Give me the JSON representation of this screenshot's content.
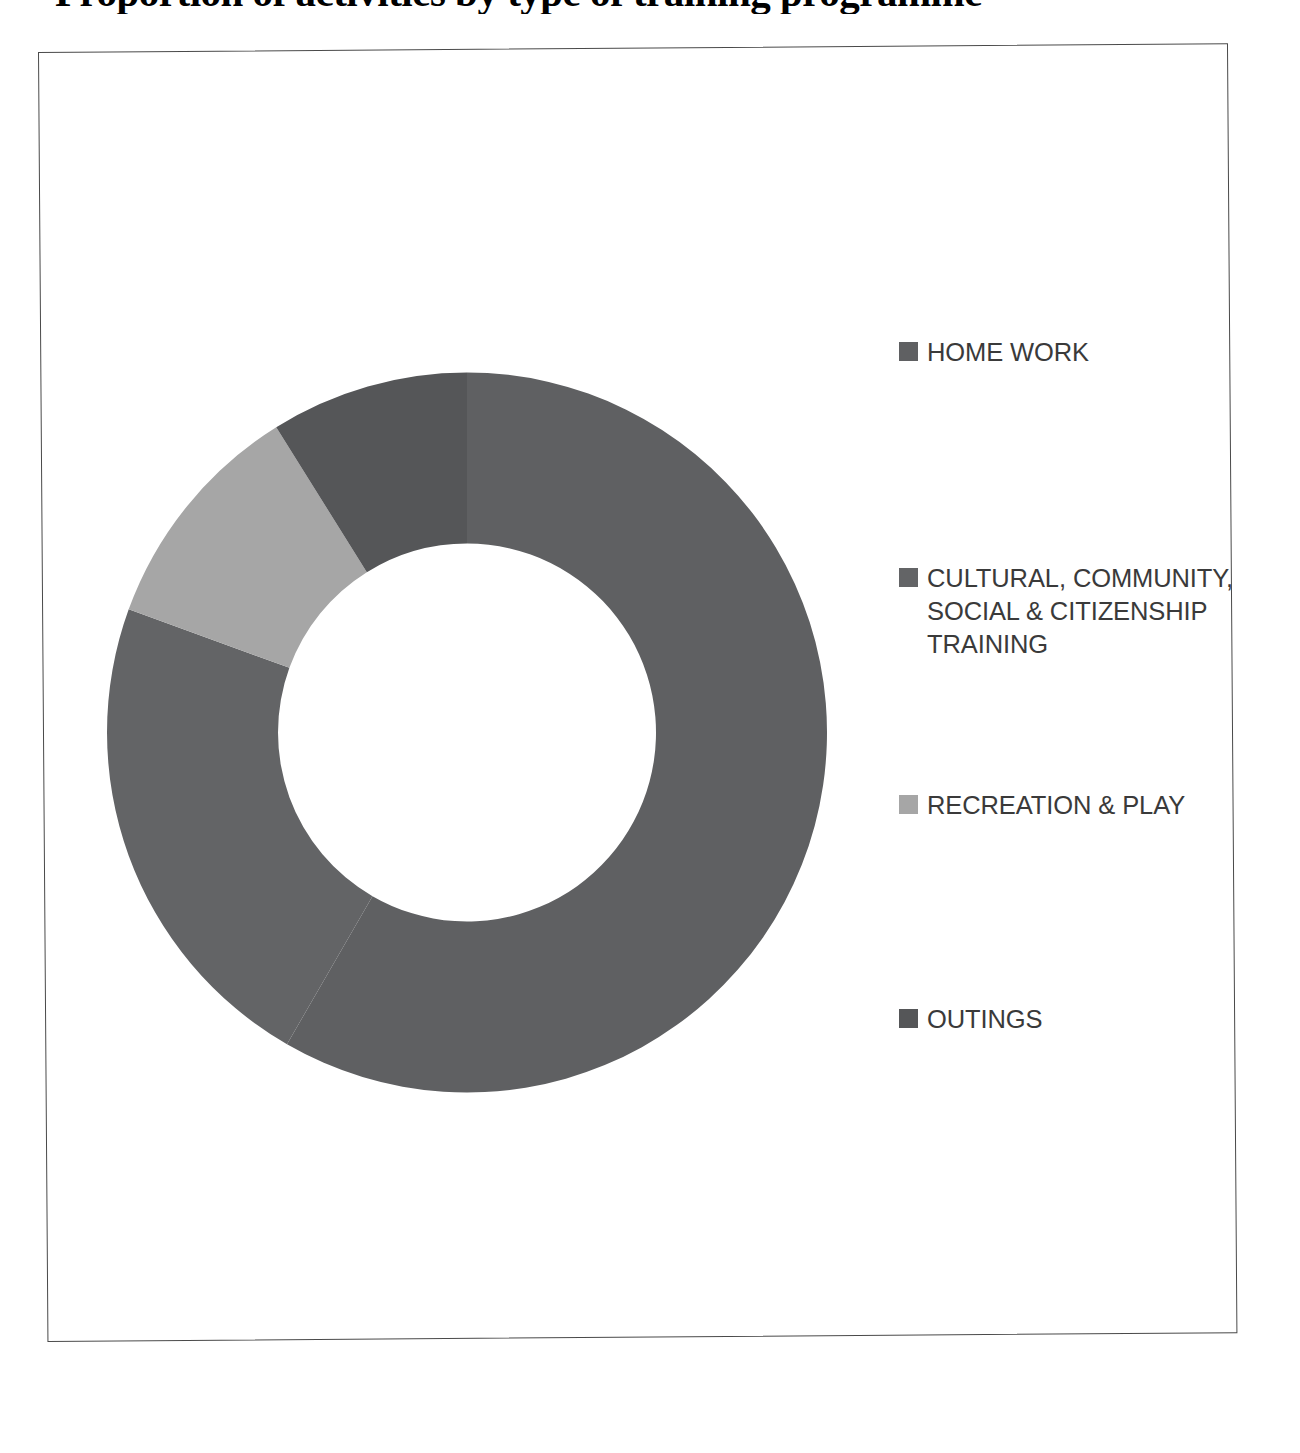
{
  "document": {
    "title_cropped": "Proportion of activities by type of training programme",
    "frame_border_color": "#4a4a4a",
    "background_color": "#ffffff"
  },
  "legend": {
    "position": "right",
    "items": [
      {
        "label": "HOME WORK",
        "color": "#5f6062",
        "swatch_name": "legend-swatch-home-work"
      },
      {
        "label": "CULTURAL, COMMUNITY,\nSOCIAL & CITIZENSHIP\nTRAINING",
        "color": "#636466",
        "swatch_name": "legend-swatch-cultural"
      },
      {
        "label": "RECREATION & PLAY",
        "color": "#a6a6a6",
        "swatch_name": "legend-swatch-recreation"
      },
      {
        "label": "OUTINGS",
        "color": "#555658",
        "swatch_name": "legend-swatch-outings"
      }
    ]
  },
  "chart_data": {
    "type": "pie",
    "variant": "donut",
    "title": "Proportion of activities by type of training programme",
    "xlabel": "",
    "ylabel": "",
    "grid": false,
    "legend_position": "right",
    "hole_ratio": 0.525,
    "start_angle_deg": 0,
    "direction": "clockwise",
    "labels": [
      "HOME WORK",
      "CULTURAL, COMMUNITY, SOCIAL & CITIZENSHIP TRAINING",
      "RECREATION & PLAY",
      "OUTINGS"
    ],
    "values": [
      58.3,
      22.2,
      10.6,
      8.9
    ],
    "value_unit": "percent",
    "colors": [
      "#5f6062",
      "#636466",
      "#a6a6a6",
      "#555658"
    ],
    "slice_angles_deg": [
      {
        "label": "HOME WORK",
        "start": 0,
        "end": 210
      },
      {
        "label": "CULTURAL, COMMUNITY, SOCIAL & CITIZENSHIP TRAINING",
        "start": 210,
        "end": 290
      },
      {
        "label": "RECREATION & PLAY",
        "start": 290,
        "end": 328
      },
      {
        "label": "OUTINGS",
        "start": 328,
        "end": 360
      }
    ],
    "data_labels_shown": false
  }
}
